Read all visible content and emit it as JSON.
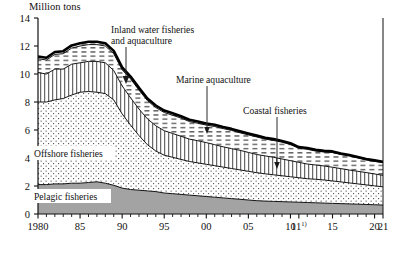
{
  "chart_data": {
    "type": "area",
    "title": "",
    "unit_label": "Million tons",
    "xlabel": "",
    "ylabel": "",
    "grid": false,
    "legend_position": "inline-annotations",
    "stacked": true,
    "ylim": [
      0,
      14
    ],
    "xlim": [
      1980,
      2021
    ],
    "y_ticks": [
      "0",
      "2",
      "4",
      "6",
      "8",
      "10",
      "12",
      "14"
    ],
    "y_tick_values": [
      0,
      2,
      4,
      6,
      8,
      10,
      12,
      14
    ],
    "x_tick_labels": [
      "1980",
      "85",
      "90",
      "95",
      "00",
      "05",
      "10",
      "11",
      "15",
      "20",
      "21"
    ],
    "x_tick_values": [
      1980,
      1985,
      1990,
      1995,
      2000,
      2005,
      2010,
      2011,
      2015,
      2020,
      2021
    ],
    "x_footnote_marker": "1)",
    "x_footnote_on": "11",
    "x": [
      1980,
      1981,
      1982,
      1983,
      1984,
      1985,
      1986,
      1987,
      1988,
      1989,
      1990,
      1991,
      1992,
      1993,
      1994,
      1995,
      1996,
      1997,
      1998,
      1999,
      2000,
      2001,
      2002,
      2003,
      2004,
      2005,
      2006,
      2007,
      2008,
      2009,
      2010,
      2011,
      2012,
      2013,
      2014,
      2015,
      2016,
      2017,
      2018,
      2019,
      2020,
      2021
    ],
    "series": [
      {
        "name": "Pelagic fisheries",
        "pattern": "solid-gray",
        "color": "#a0a0a0",
        "values": [
          2.1,
          2.1,
          2.15,
          2.15,
          2.2,
          2.2,
          2.25,
          2.3,
          2.2,
          2.05,
          1.85,
          1.75,
          1.7,
          1.65,
          1.6,
          1.5,
          1.45,
          1.4,
          1.35,
          1.3,
          1.25,
          1.2,
          1.15,
          1.1,
          1.05,
          1.0,
          0.95,
          0.92,
          0.9,
          0.88,
          0.86,
          0.84,
          0.82,
          0.8,
          0.78,
          0.76,
          0.74,
          0.72,
          0.7,
          0.68,
          0.66,
          0.64
        ]
      },
      {
        "name": "Offshore fisheries",
        "pattern": "dotted",
        "color": "#ffffff",
        "values": [
          5.9,
          5.9,
          6.0,
          6.1,
          6.3,
          6.5,
          6.5,
          6.4,
          6.4,
          6.1,
          5.3,
          4.6,
          3.9,
          3.3,
          2.9,
          2.7,
          2.6,
          2.5,
          2.4,
          2.35,
          2.3,
          2.25,
          2.2,
          2.15,
          2.1,
          2.05,
          2.0,
          1.95,
          1.9,
          1.85,
          1.8,
          1.75,
          1.7,
          1.68,
          1.65,
          1.6,
          1.55,
          1.5,
          1.45,
          1.4,
          1.35,
          1.3
        ]
      },
      {
        "name": "Coastal fisheries",
        "pattern": "vertical-lines",
        "color": "#ffffff",
        "values": [
          2.1,
          2.0,
          2.2,
          2.1,
          2.2,
          2.1,
          2.15,
          2.2,
          2.2,
          2.1,
          2.0,
          1.95,
          1.9,
          1.85,
          1.8,
          1.75,
          1.7,
          1.65,
          1.6,
          1.58,
          1.55,
          1.5,
          1.45,
          1.42,
          1.4,
          1.35,
          1.3,
          1.28,
          1.25,
          1.2,
          1.15,
          1.1,
          1.05,
          1.02,
          1.0,
          0.98,
          0.95,
          0.92,
          0.9,
          0.88,
          0.85,
          0.82
        ]
      },
      {
        "name": "Marine aquaculture",
        "pattern": "dashed-horizontal",
        "color": "#ffffff",
        "values": [
          0.99,
          1.0,
          1.05,
          1.1,
          1.15,
          1.2,
          1.2,
          1.2,
          1.2,
          1.2,
          1.15,
          1.35,
          1.35,
          1.3,
          1.3,
          1.3,
          1.3,
          1.3,
          1.25,
          1.25,
          1.25,
          1.3,
          1.3,
          1.3,
          1.25,
          1.25,
          1.25,
          1.2,
          1.2,
          1.2,
          1.15,
          1.0,
          1.05,
          1.0,
          1.0,
          1.05,
          1.0,
          1.0,
          0.95,
          0.9,
          0.9,
          0.9
        ]
      },
      {
        "name": "Inland water fisheries and aquaculture",
        "pattern": "dashed-top",
        "color": "#ffffff",
        "values": [
          0.16,
          0.16,
          0.17,
          0.18,
          0.19,
          0.2,
          0.2,
          0.2,
          0.2,
          0.2,
          0.18,
          0.17,
          0.16,
          0.15,
          0.15,
          0.14,
          0.14,
          0.13,
          0.13,
          0.12,
          0.12,
          0.12,
          0.11,
          0.11,
          0.11,
          0.1,
          0.1,
          0.1,
          0.1,
          0.09,
          0.09,
          0.09,
          0.09,
          0.08,
          0.08,
          0.08,
          0.08,
          0.07,
          0.07,
          0.07,
          0.07,
          0.07
        ]
      }
    ],
    "totals": [
      11.25,
      11.16,
      11.57,
      11.63,
      12.04,
      12.2,
      12.3,
      12.3,
      12.2,
      11.65,
      10.48,
      9.82,
      9.01,
      8.25,
      7.75,
      7.39,
      7.19,
      6.98,
      6.73,
      6.6,
      6.47,
      6.37,
      6.21,
      6.08,
      5.91,
      5.75,
      5.6,
      5.47,
      5.35,
      5.22,
      5.05,
      4.78,
      4.71,
      4.58,
      4.51,
      4.47,
      4.32,
      4.21,
      4.07,
      3.93,
      3.83,
      3.73
    ],
    "annotations": [
      {
        "label": "Inland water fisheries\nand aquaculture",
        "line1": "Inland water fisheries",
        "line2": "and aquaculture",
        "target_series": "Inland water fisheries and aquaculture"
      },
      {
        "label": "Marine aquaculture",
        "line1": "Marine aquaculture",
        "line2": "",
        "target_series": "Marine aquaculture"
      },
      {
        "label": "Coastal fisheries",
        "line1": "Coastal fisheries",
        "line2": "",
        "target_series": "Coastal fisheries"
      },
      {
        "label": "Offshore fisheries",
        "line1": "Offshore fisheries",
        "line2": "",
        "target_series": "Offshore fisheries"
      },
      {
        "label": "Pelagic fisheries",
        "line1": "Pelagic fisheries",
        "line2": "",
        "target_series": "Pelagic fisheries"
      }
    ]
  },
  "axes": {
    "unit": "Million tons",
    "y_ticks": [
      "14",
      "12",
      "10",
      "8",
      "6",
      "4",
      "2",
      "0"
    ],
    "x_ticks": [
      {
        "label": "1980"
      },
      {
        "label": "85"
      },
      {
        "label": "90"
      },
      {
        "label": "95"
      },
      {
        "label": "00"
      },
      {
        "label": "05"
      },
      {
        "label": "10"
      },
      {
        "label": "11"
      },
      {
        "label": "15"
      },
      {
        "label": "20"
      },
      {
        "label": "21"
      }
    ],
    "footnote_marker": "1)"
  },
  "labels": {
    "inland_line1": "Inland water fisheries",
    "inland_line2": "and aquaculture",
    "marine_aquaculture": "Marine aquaculture",
    "coastal": "Coastal fisheries",
    "offshore": "Offshore fisheries",
    "pelagic": "Pelagic fisheries"
  }
}
